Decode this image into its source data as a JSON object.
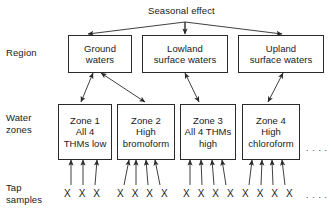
{
  "diagram": {
    "title": "Seasonal effect",
    "row_labels": {
      "region": "Region",
      "water_zones": "Water\nzones",
      "tap_samples": "Tap\nsamples"
    },
    "regions": [
      {
        "label": "Ground\nwaters"
      },
      {
        "label": "Lowland\nsurface waters"
      },
      {
        "label": "Upland\nsurface waters"
      }
    ],
    "zones": [
      {
        "label": "Zone 1\nAll 4\nTHMs low"
      },
      {
        "label": "Zone 2\nHigh\nbromoform"
      },
      {
        "label": "Zone 3\nAll 4 THMs\nhigh"
      },
      {
        "label": "Zone 4\nHigh\nchloroform"
      }
    ],
    "samples": [
      {
        "marks": "X X X"
      },
      {
        "marks": "X X X X"
      },
      {
        "marks": "X X X X"
      },
      {
        "marks": "X X X X"
      }
    ],
    "ellipsis": {
      "zones_more": ". . . .",
      "samples_more": ". . . ."
    },
    "colors": {
      "background": "#ffffff",
      "stroke": "#2a2a2a",
      "text": "#1a1a1a"
    }
  }
}
